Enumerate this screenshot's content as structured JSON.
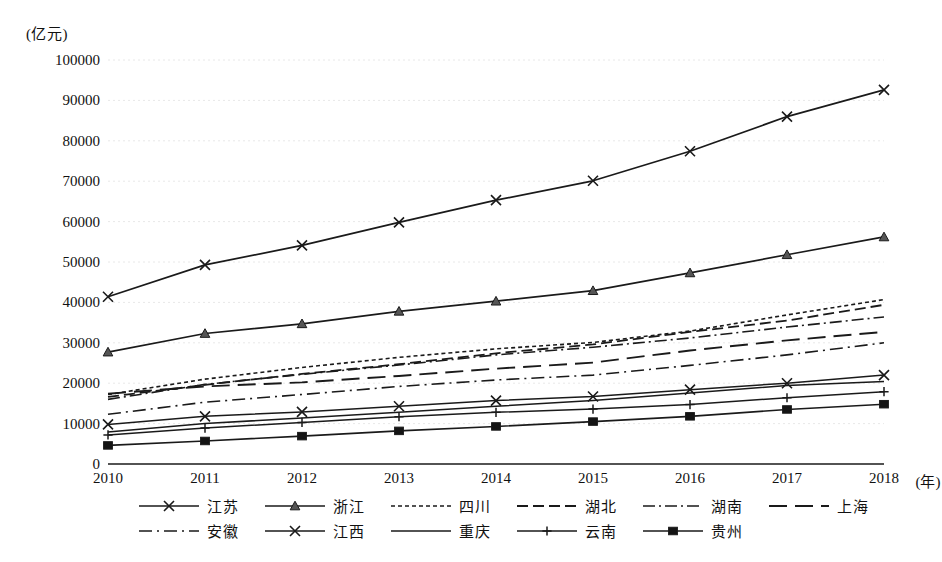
{
  "chart_data": {
    "type": "line",
    "title": "",
    "xlabel": "年",
    "ylabel": "亿元",
    "y_unit_label": "(亿元)",
    "x_unit_label": "(年)",
    "grid": true,
    "legend_position": "bottom",
    "xlim": [
      2010,
      2018
    ],
    "ylim": [
      0,
      100000
    ],
    "ytick_step": 10000,
    "categories": [
      2010,
      2011,
      2012,
      2013,
      2014,
      2015,
      2016,
      2017,
      2018
    ],
    "x": [
      "2010",
      "2011",
      "2012",
      "2013",
      "2014",
      "2015",
      "2016",
      "2017",
      "2018"
    ],
    "ytick_labels": [
      "100000",
      "90000",
      "80000",
      "70000",
      "60000",
      "50000",
      "40000",
      "30000",
      "20000",
      "10000",
      "0"
    ],
    "ytick_values": [
      100000,
      90000,
      80000,
      70000,
      60000,
      50000,
      40000,
      30000,
      20000,
      10000,
      0
    ],
    "series": [
      {
        "name": "江苏",
        "style": "solid",
        "marker": "x",
        "width": 1.7,
        "values": [
          41400,
          49300,
          54100,
          59800,
          65300,
          70100,
          77400,
          86000,
          92600
        ]
      },
      {
        "name": "浙江",
        "style": "solid",
        "marker": "triangle",
        "width": 1.7,
        "values": [
          27700,
          32300,
          34700,
          37800,
          40300,
          42900,
          47300,
          51800,
          56200
        ]
      },
      {
        "name": "四川",
        "style": "dotted",
        "marker": "none",
        "width": 1.6,
        "values": [
          17200,
          21000,
          23900,
          26400,
          28500,
          30100,
          32900,
          36900,
          40700
        ]
      },
      {
        "name": "湖北",
        "style": "dashed",
        "marker": "none",
        "width": 1.8,
        "values": [
          16600,
          19600,
          22300,
          24700,
          27400,
          29600,
          32700,
          35500,
          39400
        ]
      },
      {
        "name": "湖南",
        "style": "dashdot",
        "marker": "none",
        "width": 1.6,
        "values": [
          16000,
          19700,
          22200,
          24500,
          27000,
          28900,
          31200,
          33900,
          36400
        ]
      },
      {
        "name": "上海",
        "style": "longdash",
        "marker": "none",
        "width": 1.9,
        "values": [
          17400,
          19200,
          20200,
          21800,
          23600,
          25100,
          28100,
          30600,
          32700
        ]
      },
      {
        "name": "安徽",
        "style": "dashdot2",
        "marker": "none",
        "width": 1.6,
        "values": [
          12300,
          15300,
          17200,
          19200,
          20800,
          22000,
          24400,
          27000,
          30000
        ]
      },
      {
        "name": "江西",
        "style": "solid",
        "marker": "x",
        "width": 1.5,
        "values": [
          9800,
          11800,
          12900,
          14300,
          15700,
          16700,
          18400,
          20000,
          22000
        ]
      },
      {
        "name": "重庆",
        "style": "solid",
        "marker": "none",
        "width": 1.5,
        "values": [
          7900,
          10000,
          11400,
          12800,
          14300,
          15700,
          17600,
          19400,
          20400
        ]
      },
      {
        "name": "云南",
        "style": "solid",
        "marker": "plus",
        "width": 1.5,
        "values": [
          7200,
          8900,
          10300,
          11700,
          12800,
          13600,
          14700,
          16400,
          17900
        ]
      },
      {
        "name": "贵州",
        "style": "solid",
        "marker": "square",
        "width": 1.6,
        "values": [
          4600,
          5700,
          6900,
          8200,
          9300,
          10500,
          11800,
          13500,
          14800
        ]
      }
    ]
  },
  "legend": {
    "rows": [
      [
        "江苏",
        "浙江",
        "四川",
        "湖北",
        "湖南",
        "上海"
      ],
      [
        "安徽",
        "江西",
        "重庆",
        "云南",
        "贵州"
      ]
    ]
  },
  "colors": {
    "line": "#1a1a1a",
    "grid": "#e8e8e8",
    "axis": "#1a1a1a",
    "background": "#ffffff",
    "text": "#111111"
  }
}
